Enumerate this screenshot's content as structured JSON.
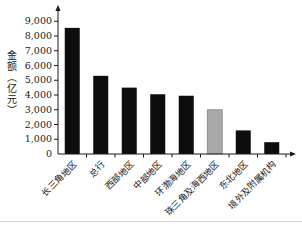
{
  "figure": {
    "background": "#ffffff",
    "frame_rule_color": "#d6d6d6"
  },
  "chart_data": {
    "type": "bar",
    "title": "",
    "xlabel": "",
    "ylabel": "金额（亿元）",
    "categories": [
      "长三角地区",
      "总行",
      "西部地区",
      "中部地区",
      "环渤海地区",
      "珠三角及海西地区",
      "东北地区",
      "境外及附属机构"
    ],
    "values": [
      8550,
      5300,
      4500,
      4050,
      3950,
      3000,
      1600,
      800
    ],
    "bar_colors": [
      "#0d0d0d",
      "#0d0d0d",
      "#0d0d0d",
      "#0d0d0d",
      "#0d0d0d",
      "#a8a8a8",
      "#0d0d0d",
      "#0d0d0d"
    ],
    "bar_strokes": [
      "none",
      "none",
      "none",
      "none",
      "none",
      "#7f7f7f",
      "none",
      "none"
    ],
    "ylim": [
      0,
      9000
    ],
    "ytick_step": 1000,
    "ytick_labels": [
      "0",
      "1,000",
      "2,000",
      "3,000",
      "4,000",
      "5,000",
      "6,000",
      "7,000",
      "8,000",
      "9,000"
    ],
    "grid": false,
    "legend": "none",
    "axis_color": "#1a1a1a",
    "tick_label_color": "#1a1a1a",
    "x_labels_rotation_deg": -45
  }
}
